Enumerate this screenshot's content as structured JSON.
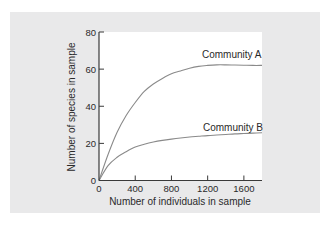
{
  "chart_data": {
    "type": "line",
    "title": "",
    "xlabel": "Number of individuals in sample",
    "ylabel": "Number of species in sample",
    "xlim": [
      0,
      1800
    ],
    "ylim": [
      0,
      80
    ],
    "xticks": [
      0,
      400,
      800,
      1200,
      1600
    ],
    "yticks": [
      0,
      20,
      40,
      60,
      80
    ],
    "grid": false,
    "legend": "inline labels near curve ends",
    "x": [
      0,
      100,
      200,
      300,
      400,
      500,
      600,
      700,
      800,
      900,
      1000,
      1100,
      1200,
      1300,
      1400,
      1500,
      1600,
      1700,
      1800
    ],
    "series": [
      {
        "name": "Community A",
        "values": [
          0,
          14,
          26,
          35,
          42,
          48,
          52,
          55,
          57.5,
          59,
          60.5,
          61.5,
          62,
          62.3,
          62.3,
          62.2,
          62.1,
          62,
          62
        ]
      },
      {
        "name": "Community B",
        "values": [
          0,
          8,
          12.5,
          15.5,
          18,
          19.5,
          20.7,
          21.6,
          22.3,
          22.9,
          23.4,
          23.8,
          24.2,
          24.5,
          24.8,
          25.1,
          25.3,
          25.5,
          25.7
        ]
      }
    ]
  },
  "labels": {
    "series_a": "Community A",
    "series_b": "Community B",
    "xlabel": "Number of individuals in sample",
    "ylabel": "Number of species in sample",
    "xticks": [
      "0",
      "400",
      "800",
      "1200",
      "1600"
    ],
    "yticks": [
      "0",
      "20",
      "40",
      "60",
      "80"
    ]
  },
  "colors": {
    "panel_bg": "#e9e9ea",
    "plot_bg": "#ffffff",
    "axis": "#3a3a3a",
    "curve": "#8a8a8a"
  }
}
